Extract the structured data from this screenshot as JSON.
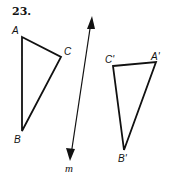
{
  "problem_number": "23.",
  "line": {
    "label": "m",
    "start": [
      92,
      17
    ],
    "end": [
      70,
      160
    ],
    "label_pos": [
      65,
      171
    ]
  },
  "triangle_original": {
    "vertices": {
      "A": {
        "label": "A",
        "point": [
          22,
          37
        ],
        "label_pos": [
          13,
          34
        ]
      },
      "B": {
        "label": "B",
        "point": [
          22,
          131
        ],
        "label_pos": [
          14,
          143
        ]
      },
      "C": {
        "label": "C",
        "point": [
          61,
          57
        ],
        "label_pos": [
          64,
          55
        ]
      }
    }
  },
  "triangle_image": {
    "vertices": {
      "A_prime": {
        "label": "A'",
        "point": [
          156,
          62
        ],
        "label_pos": [
          152,
          60
        ]
      },
      "B_prime": {
        "label": "B'",
        "point": [
          124,
          150
        ],
        "label_pos": [
          119,
          162
        ]
      },
      "C_prime": {
        "label": "C'",
        "point": [
          113,
          66
        ],
        "label_pos": [
          106,
          62
        ]
      }
    }
  },
  "colors": {
    "stroke": "#111111",
    "background": "#ffffff"
  }
}
